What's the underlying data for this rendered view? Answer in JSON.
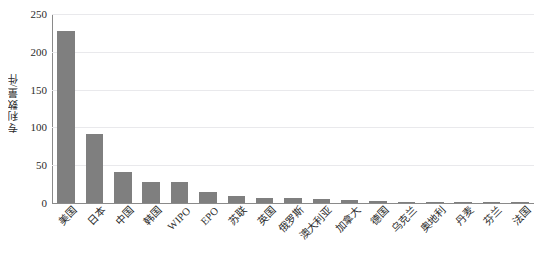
{
  "chart_data": {
    "type": "bar",
    "title": "",
    "subtitle": "",
    "xlabel": "",
    "ylabel": "专利数量/件",
    "ylim": [
      0,
      250
    ],
    "yticks": [
      0,
      50,
      100,
      150,
      200,
      250
    ],
    "ytick_labels": [
      "0",
      "50",
      "100",
      "150",
      "200",
      "250"
    ],
    "grid": true,
    "legend": null,
    "legend_position": "none",
    "bar_color": "#7f7f7f",
    "categories": [
      "美国",
      "日本",
      "中国",
      "韩国",
      "WIPO",
      "EPO",
      "苏联",
      "英国",
      "俄罗斯",
      "澳大利亚",
      "加拿大",
      "德国",
      "乌克兰",
      "奥地利",
      "丹麦",
      "芬兰",
      "法国"
    ],
    "values": [
      228,
      91,
      41,
      28,
      28,
      14,
      9,
      7,
      6,
      5,
      4,
      3,
      2,
      2,
      1,
      1,
      1
    ],
    "annotations": []
  },
  "figure": {
    "background": "#ffffff",
    "axis_color": "#8a8a8a",
    "grid_color": "#e9e9ec",
    "text_color": "#2b2b2b"
  }
}
